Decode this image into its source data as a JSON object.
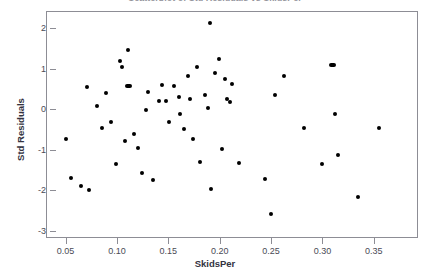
{
  "chart_data": {
    "type": "scatter",
    "title": "Scatterplot of Std Residuals vs SkidsPer",
    "xlabel": "SkidsPer",
    "ylabel": "Std Residuals",
    "xlim": [
      0.031,
      0.393
    ],
    "ylim": [
      -3.18,
      2.43
    ],
    "xticks": [
      0.05,
      0.1,
      0.15,
      0.2,
      0.25,
      0.3,
      0.35
    ],
    "xtick_labels": [
      "0.05",
      "0.10",
      "0.15",
      "0.20",
      "0.25",
      "0.30",
      "0.35"
    ],
    "yticks": [
      2,
      1,
      0,
      -1,
      -2,
      -3
    ],
    "ytick_labels": [
      "2",
      "1",
      "0",
      "-1",
      "-2",
      "-3"
    ],
    "grid": false,
    "legend": null,
    "marker": "filled-circle",
    "marker_color": "#000000",
    "points": [
      {
        "x": 0.0495,
        "y": -0.7
      },
      {
        "x": 0.0545,
        "y": -1.68
      },
      {
        "x": 0.0645,
        "y": -1.87
      },
      {
        "x": 0.0695,
        "y": 0.57
      },
      {
        "x": 0.0715,
        "y": -1.98
      },
      {
        "x": 0.0795,
        "y": 0.1
      },
      {
        "x": 0.0845,
        "y": -0.43
      },
      {
        "x": 0.0885,
        "y": 0.43
      },
      {
        "x": 0.0935,
        "y": -0.28
      },
      {
        "x": 0.0985,
        "y": -1.32
      },
      {
        "x": 0.1025,
        "y": 1.22
      },
      {
        "x": 0.1035,
        "y": 1.07
      },
      {
        "x": 0.1065,
        "y": -0.75
      },
      {
        "x": 0.1095,
        "y": 1.5
      },
      {
        "x": 0.1105,
        "y": 0.6
      },
      {
        "x": 0.1125,
        "y": 0.6
      },
      {
        "x": 0.1155,
        "y": -0.58
      },
      {
        "x": 0.1195,
        "y": -0.93
      },
      {
        "x": 0.1235,
        "y": -1.55
      },
      {
        "x": 0.1275,
        "y": 0.02
      },
      {
        "x": 0.1295,
        "y": 0.45
      },
      {
        "x": 0.1345,
        "y": -1.73
      },
      {
        "x": 0.1395,
        "y": 0.22
      },
      {
        "x": 0.1425,
        "y": 0.63
      },
      {
        "x": 0.1465,
        "y": 0.22
      },
      {
        "x": 0.1495,
        "y": -0.3
      },
      {
        "x": 0.1545,
        "y": 0.6
      },
      {
        "x": 0.1595,
        "y": 0.32
      },
      {
        "x": 0.1605,
        "y": -0.08
      },
      {
        "x": 0.1645,
        "y": -0.45
      },
      {
        "x": 0.1685,
        "y": 0.85
      },
      {
        "x": 0.1705,
        "y": 0.28
      },
      {
        "x": 0.1735,
        "y": -0.72
      },
      {
        "x": 0.1765,
        "y": 1.07
      },
      {
        "x": 0.1795,
        "y": -1.27
      },
      {
        "x": 0.1845,
        "y": 0.38
      },
      {
        "x": 0.1875,
        "y": 0.05
      },
      {
        "x": 0.1895,
        "y": 2.15
      },
      {
        "x": 0.1905,
        "y": -1.95
      },
      {
        "x": 0.1945,
        "y": 0.92
      },
      {
        "x": 0.1985,
        "y": 1.27
      },
      {
        "x": 0.2015,
        "y": -0.95
      },
      {
        "x": 0.2045,
        "y": 0.77
      },
      {
        "x": 0.2065,
        "y": 0.28
      },
      {
        "x": 0.2095,
        "y": 0.2
      },
      {
        "x": 0.2115,
        "y": 0.65
      },
      {
        "x": 0.2175,
        "y": -1.3
      },
      {
        "x": 0.2435,
        "y": -1.7
      },
      {
        "x": 0.2485,
        "y": -2.55
      },
      {
        "x": 0.2525,
        "y": 0.38
      },
      {
        "x": 0.2615,
        "y": 0.85
      },
      {
        "x": 0.2815,
        "y": -0.43
      },
      {
        "x": 0.2985,
        "y": -1.32
      },
      {
        "x": 0.3085,
        "y": 1.12
      },
      {
        "x": 0.3105,
        "y": 1.05
      },
      {
        "x": 0.3115,
        "y": -0.08
      },
      {
        "x": 0.3145,
        "y": -1.1
      },
      {
        "x": 0.3335,
        "y": -2.15
      },
      {
        "x": 0.3545,
        "y": -0.43
      }
    ]
  }
}
